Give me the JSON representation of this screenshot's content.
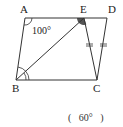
{
  "diagram": {
    "type": "geometry",
    "shape": "quadrilateral ABCD with segment BE",
    "points": {
      "A": {
        "label": "A",
        "x": 25,
        "y": 18
      },
      "E": {
        "label": "E",
        "x": 84,
        "y": 18
      },
      "D": {
        "label": "D",
        "x": 107,
        "y": 18
      },
      "B": {
        "label": "B",
        "x": 16,
        "y": 80
      },
      "C": {
        "label": "C",
        "x": 97,
        "y": 80
      }
    },
    "angle_label": "100°",
    "equal_marks": "EC = DC",
    "answer": "(   60°   )"
  }
}
